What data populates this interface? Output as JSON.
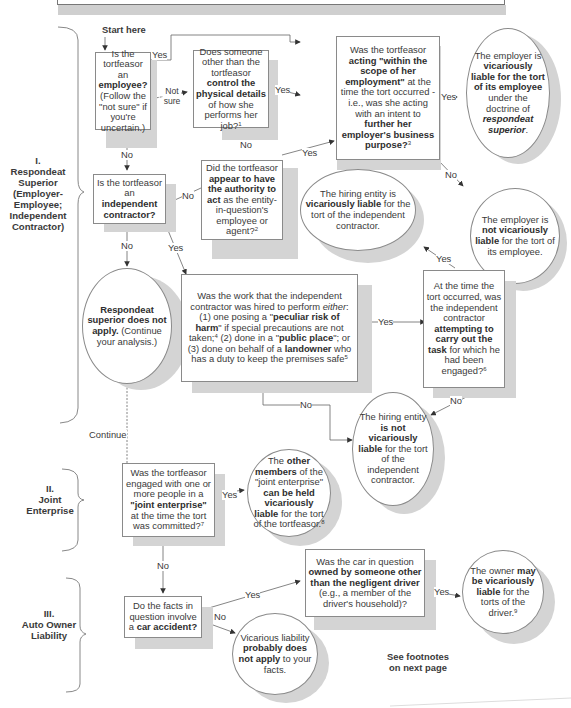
{
  "start_label": "Start here",
  "sections": [
    {
      "id": "I",
      "numeral": "I.",
      "title": "Respondeat Superior (Employer-Employee; Independent Contractor)"
    },
    {
      "id": "II",
      "numeral": "II.",
      "title": "Joint Enterprise"
    },
    {
      "id": "III",
      "numeral": "III.",
      "title": "Auto Owner Liability"
    }
  ],
  "nodes": {
    "is_employee": {
      "pre": "Is the tortfeasor an ",
      "bold": "employee?",
      "post": " (Follow the \"not sure\" if you're uncertain.)"
    },
    "control_details": {
      "pre": "Does someone other than the tortfeasor ",
      "bold": "control the physical details",
      "post": " of how she performs her job?",
      "footnote": "1"
    },
    "scope_employment": {
      "pre": "Was the tortfeasor ",
      "bold1": "acting \"within the scope of her employment\"",
      "mid": " at the time the tort occurred - i.e., was she acting with an intent to ",
      "bold2": "further her employer's business purpose?",
      "footnote": "3"
    },
    "employer_liable": {
      "pre": "The employer is ",
      "bold": "vicariously liable for the tort of its employee",
      "mid": " under the doctrine of ",
      "italic": "respondeat superior",
      "post": "."
    },
    "apparent_authority": {
      "pre": "Did the tortfeasor ",
      "bold": "appear to have the authority to act",
      "post": " as the entity-in-question's employee or agent?",
      "footnote": "2"
    },
    "is_independent_contractor": {
      "pre": "Is the tortfeasor an ",
      "bold": "independent contractor?"
    },
    "employer_not_liable": {
      "pre": "The employer is ",
      "bold": "not vicariously liable",
      "post": " for the tort of its employee."
    },
    "hiring_entity_liable": {
      "pre": "The hiring entity is ",
      "bold": "vicariously liable",
      "post": " for the tort of the independent contractor."
    },
    "rs_not_apply": {
      "bold": "Respondeat superior does not apply.",
      "post": " (Continue your analysis.)"
    },
    "work_type": {
      "pre": "Was the work that the independent contractor was hired to perform ",
      "italic": "either",
      "p1": ": (1) one posing a \"",
      "b1": "peculiar risk of harm",
      "p2": "\" if special precautions are not taken;",
      "fn1": "4",
      "p3": " (2) done in a \"",
      "b2": "public place",
      "p4": "\"; or (3) done on behalf of a ",
      "b3": "landowner",
      "p5": " who has a duty to keep the premises safe",
      "fn2": "5"
    },
    "attempting_task": {
      "pre": "At the time the tort occurred, was the independent contractor ",
      "bold": "attempting to carry out the task",
      "post": " for which he had been engaged?",
      "footnote": "6"
    },
    "hiring_entity_not_liable": {
      "pre": "The hiring entity ",
      "bold1": "is not vicariously liable",
      "post": " for the tort of the independent contractor."
    },
    "joint_enterprise": {
      "pre": "Was the tortfeasor engaged with one or more people in a ",
      "bold": "\"joint enterprise\"",
      "post": " at the time the tort was committed?",
      "footnote": "7"
    },
    "je_liable": {
      "pre": "The ",
      "bold1": "other members",
      "mid": " of the \"joint enterprise\" ",
      "bold2": "can be held vicariously liable",
      "post": " for the tort of the tortfeasor.",
      "footnote": "8"
    },
    "car_accident": {
      "pre": "Do the facts in question involve a ",
      "bold": "car accident?"
    },
    "car_owned_other": {
      "pre": "Was the car in question ",
      "bold": "owned by someone other than the negligent driver",
      "post": " (e.g., a member of the driver's household)?"
    },
    "no_vicarious": {
      "pre": "Vicarious liability ",
      "bold": "probably does not apply",
      "post": " to your facts."
    },
    "owner_liable": {
      "pre": "The owner ",
      "bold": "may be vicariously liable",
      "post": " for the torts of the driver.",
      "footnote": "9"
    }
  },
  "edge_labels": {
    "yes": "Yes",
    "no": "No",
    "not_sure": "Not sure",
    "continue": "Continue"
  },
  "footer_note": "See footnotes on next page"
}
